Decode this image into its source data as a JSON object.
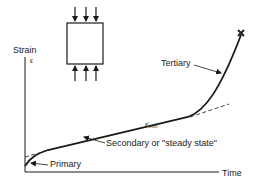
{
  "diagram": {
    "type": "creep-curve",
    "specimen": {
      "shape": "rectangle",
      "arrows_top": 3,
      "arrows_bottom": 3,
      "loading": "compression"
    },
    "axes": {
      "y_label": "Strain",
      "y_symbol": "ϵ",
      "x_label": "Time"
    },
    "stages": [
      {
        "id": "primary",
        "label": "Primary"
      },
      {
        "id": "secondary",
        "label": "Secondary or \"steady state\""
      },
      {
        "id": "tertiary",
        "label": "Tertiary"
      }
    ],
    "rate_label": {
      "symbol": "ε̇",
      "subscript": "min"
    },
    "failure_marker": "×",
    "colors": {
      "line": "#1a1a1a",
      "background": "#ffffff"
    }
  }
}
